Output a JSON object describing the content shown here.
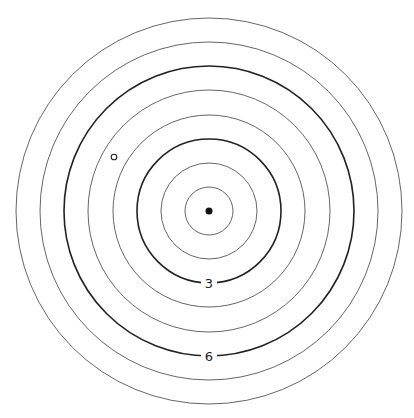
{
  "diagram": {
    "type": "concentric-circles",
    "center": {
      "x": 209,
      "y": 211
    },
    "ring_spacing": 24.1,
    "rings": [
      {
        "index": 1,
        "radius": 24,
        "bold": false,
        "label": ""
      },
      {
        "index": 2,
        "radius": 48,
        "bold": false,
        "label": ""
      },
      {
        "index": 3,
        "radius": 72,
        "bold": true,
        "label": "3"
      },
      {
        "index": 4,
        "radius": 96,
        "bold": false,
        "label": ""
      },
      {
        "index": 5,
        "radius": 121,
        "bold": false,
        "label": ""
      },
      {
        "index": 6,
        "radius": 145,
        "bold": true,
        "label": "6"
      },
      {
        "index": 7,
        "radius": 169,
        "bold": false,
        "label": ""
      },
      {
        "index": 8,
        "radius": 193,
        "bold": false,
        "label": ""
      }
    ],
    "center_point": {
      "x": 209,
      "y": 211,
      "r": 3.5,
      "filled": true,
      "color": "#111111"
    },
    "marker_point": {
      "x": 114,
      "y": 157,
      "r": 2.8,
      "filled": false,
      "color": "#222222"
    },
    "labels": {
      "ring_3": "3",
      "ring_6": "6"
    }
  }
}
